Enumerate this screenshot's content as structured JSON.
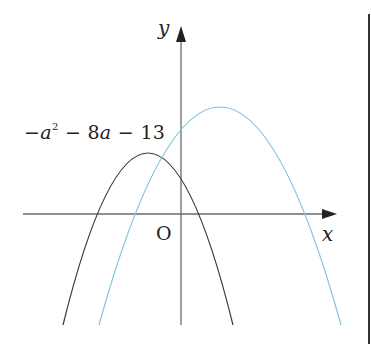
{
  "diagram": {
    "type": "parabola-graph",
    "axes": {
      "x_label": "x",
      "y_label": "y",
      "origin_label": "O"
    },
    "annotation": {
      "y_intercept_label_parts": [
        "−",
        "a",
        "2",
        " − 8",
        "a",
        " − 13"
      ],
      "y_intercept_label_text": "−a² − 8a − 13"
    },
    "curves": [
      {
        "name": "black-parabola",
        "color": "#3a3a3a",
        "opens": "down",
        "vertex_side": "left of y-axis"
      },
      {
        "name": "blue-parabola",
        "color": "#7ec4e0",
        "opens": "down",
        "vertex_side": "right of y-axis",
        "y_intercept": "−a² − 8a − 13"
      }
    ],
    "colors": {
      "axis": "#6b6b6b",
      "black_curve": "#3a3a3a",
      "blue_curve": "#7ec4e0",
      "text": "#222222",
      "border": "#333333"
    }
  }
}
